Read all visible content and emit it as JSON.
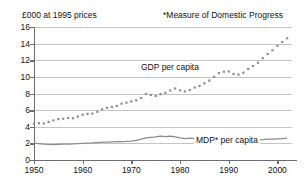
{
  "header": {
    "unit_label": "£000 at 1995 prices",
    "footnote_label": "*Measure of Domestic Progress"
  },
  "chart_data": {
    "type": "line",
    "title": "",
    "subtitle": "",
    "xlabel": "",
    "ylabel": "£000 at 1995 prices",
    "xlim": [
      1950,
      2003
    ],
    "ylim": [
      0,
      16
    ],
    "grid": true,
    "legend_position": "inline-annotation",
    "x_ticks": [
      1950,
      1960,
      1970,
      1980,
      1990,
      2000
    ],
    "y_ticks": [
      0,
      2,
      4,
      6,
      8,
      10,
      12,
      14,
      16
    ],
    "annotations": [
      "GDP per capita",
      "MDP* per capita",
      "*Measure of Domestic Progress"
    ],
    "x": [
      1950,
      1951,
      1952,
      1953,
      1954,
      1955,
      1956,
      1957,
      1958,
      1959,
      1960,
      1961,
      1962,
      1963,
      1964,
      1965,
      1966,
      1967,
      1968,
      1969,
      1970,
      1971,
      1972,
      1973,
      1974,
      1975,
      1976,
      1977,
      1978,
      1979,
      1980,
      1981,
      1982,
      1983,
      1984,
      1985,
      1986,
      1987,
      1988,
      1989,
      1990,
      1991,
      1992,
      1993,
      1994,
      1995,
      1996,
      1997,
      1998,
      1999,
      2000,
      2001,
      2002
    ],
    "series": [
      {
        "name": "GDP per capita",
        "marker": "square",
        "style": "dotted-markers",
        "color": "#8c8c8c",
        "values": [
          4.35,
          4.42,
          4.4,
          4.58,
          4.76,
          4.92,
          4.97,
          5.05,
          5.02,
          5.22,
          5.45,
          5.55,
          5.58,
          5.8,
          6.1,
          6.28,
          6.38,
          6.5,
          6.78,
          6.9,
          7.05,
          7.18,
          7.45,
          7.95,
          7.82,
          7.7,
          7.92,
          8.08,
          8.35,
          8.6,
          8.38,
          8.25,
          8.42,
          8.72,
          8.92,
          9.22,
          9.55,
          10.0,
          10.45,
          10.62,
          10.65,
          10.35,
          10.28,
          10.5,
          10.95,
          11.3,
          11.7,
          12.25,
          12.75,
          13.2,
          13.75,
          14.2,
          14.65
        ]
      },
      {
        "name": "MDP* per capita",
        "marker": "none",
        "style": "solid",
        "color": "#8c8c8c",
        "values": [
          2.02,
          1.98,
          1.92,
          1.88,
          1.86,
          1.88,
          1.9,
          1.92,
          1.93,
          1.96,
          2.0,
          2.04,
          2.06,
          2.1,
          2.14,
          2.16,
          2.18,
          2.2,
          2.22,
          2.24,
          2.28,
          2.36,
          2.5,
          2.66,
          2.72,
          2.78,
          2.88,
          2.8,
          2.86,
          2.78,
          2.66,
          2.56,
          2.62,
          2.58,
          2.5,
          2.46,
          2.48,
          2.44,
          2.4,
          2.38,
          2.42,
          2.38,
          2.34,
          2.36,
          2.4,
          2.44,
          2.42,
          2.46,
          2.52,
          2.5,
          2.54,
          2.58,
          2.62
        ]
      }
    ]
  }
}
